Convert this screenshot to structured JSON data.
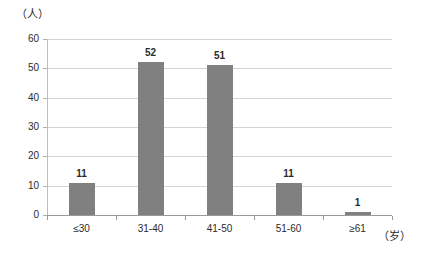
{
  "chart_data": {
    "type": "bar",
    "title": "",
    "subtitle": "",
    "xlabel": "（岁）",
    "ylabel": "（人）",
    "categories": [
      "≤30",
      "31-40",
      "41-50",
      "51-60",
      "≥61"
    ],
    "values": [
      11,
      52,
      51,
      11,
      1
    ],
    "series": [
      {
        "name": "人数",
        "values": [
          11,
          52,
          51,
          11,
          1
        ]
      }
    ],
    "data_labels": [
      "11",
      "52",
      "51",
      "11",
      "1"
    ],
    "ylim": [
      0,
      60
    ],
    "yticks": [
      0,
      10,
      20,
      30,
      40,
      50,
      60
    ],
    "ytick_labels": [
      "0",
      "10",
      "20",
      "30",
      "40",
      "50",
      "60"
    ],
    "grid": "horizontal",
    "legend": "none",
    "bar_color": "#808080",
    "gridline_color": "#d4d4d4",
    "axis_color": "#9a9a9a",
    "background_color": "#ffffff"
  },
  "axes": {
    "y_unit_caption": "（人）",
    "x_unit_caption": "（岁）"
  }
}
